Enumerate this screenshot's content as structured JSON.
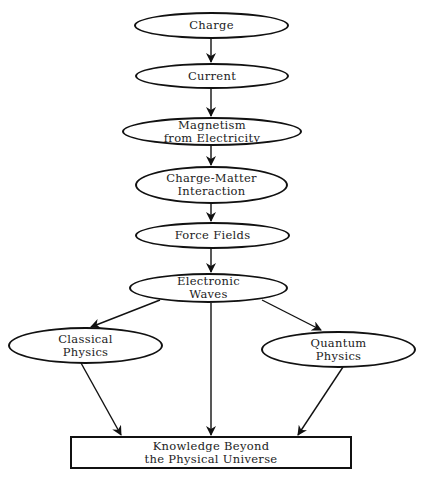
{
  "diagram": {
    "top_caption_partial": "...",
    "nodes": {
      "charge": {
        "lines": [
          "Charge"
        ]
      },
      "current": {
        "lines": [
          "Current"
        ]
      },
      "magnetism": {
        "lines": [
          "Magnetism",
          "from Electricity"
        ]
      },
      "charge_matter": {
        "lines": [
          "Charge-Matter",
          "Interaction"
        ]
      },
      "force_fields": {
        "lines": [
          "Force Fields"
        ]
      },
      "electronic_waves": {
        "lines": [
          "Electronic",
          "Waves"
        ]
      },
      "classical": {
        "lines": [
          "Classical",
          "Physics"
        ]
      },
      "quantum": {
        "lines": [
          "Quantum",
          "Physics"
        ]
      },
      "knowledge": {
        "lines": [
          "Knowledge Beyond",
          "the Physical Universe"
        ]
      }
    },
    "edges": [
      {
        "from": "Charge",
        "to": "Current"
      },
      {
        "from": "Current",
        "to": "Magnetism from Electricity"
      },
      {
        "from": "Magnetism from Electricity",
        "to": "Charge-Matter Interaction"
      },
      {
        "from": "Charge-Matter Interaction",
        "to": "Force Fields"
      },
      {
        "from": "Force Fields",
        "to": "Electronic Waves"
      },
      {
        "from": "Electronic Waves",
        "to": "Classical Physics"
      },
      {
        "from": "Electronic Waves",
        "to": "Quantum Physics"
      },
      {
        "from": "Electronic Waves",
        "to": "Knowledge Beyond the Physical Universe"
      },
      {
        "from": "Classical Physics",
        "to": "Knowledge Beyond the Physical Universe"
      },
      {
        "from": "Quantum Physics",
        "to": "Knowledge Beyond the Physical Universe"
      }
    ],
    "colors": {
      "stroke": "#111111",
      "background": "#ffffff",
      "text": "#222222"
    }
  }
}
